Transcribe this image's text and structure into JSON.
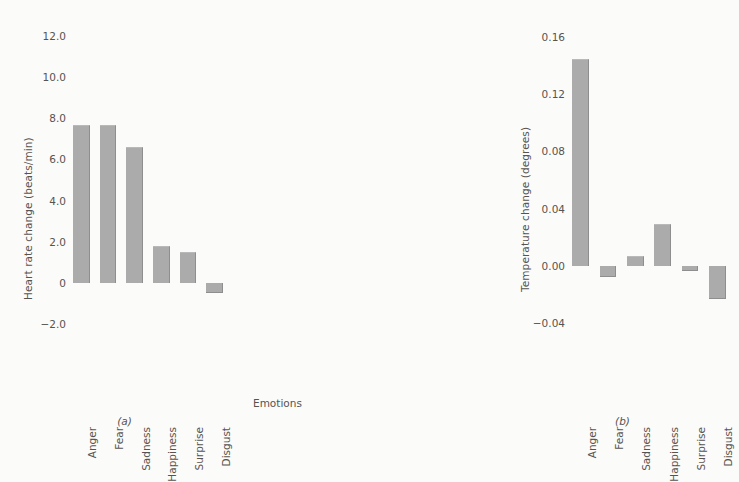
{
  "chart_data": [
    {
      "type": "bar",
      "panel": "a",
      "caption": "(a)",
      "title": "",
      "xlabel": "",
      "ylabel": "Heart rate change (beats/min)",
      "categories": [
        "Anger",
        "Fear",
        "Sadness",
        "Happiness",
        "Surprise",
        "Disgust"
      ],
      "values": [
        7.7,
        7.7,
        6.6,
        1.8,
        1.5,
        -0.5
      ],
      "yticks": [
        "12.0",
        "10.0",
        "8.0",
        "6.0",
        "4.0",
        "2.0",
        "0",
        "-2.0"
      ],
      "ytickvalues": [
        12.0,
        10.0,
        8.0,
        6.0,
        4.0,
        2.0,
        0,
        -2.0
      ],
      "ylim": [
        -2.8,
        12.8
      ],
      "grid": false,
      "legend": "none",
      "bar_color": "#ababab"
    },
    {
      "type": "bar",
      "panel": "b",
      "caption": "(b)",
      "title": "",
      "xlabel": "Emotions",
      "ylabel": "Temperature change (degrees)",
      "categories": [
        "Anger",
        "Fear",
        "Sadness",
        "Happiness",
        "Surprise",
        "Disgust"
      ],
      "values": [
        0.145,
        -0.008,
        0.007,
        0.029,
        -0.004,
        -0.023
      ],
      "yticks": [
        "0.16",
        "0.12",
        "0.08",
        "0.04",
        "0.00",
        "-0.04"
      ],
      "ytickvalues": [
        0.16,
        0.12,
        0.08,
        0.04,
        0.0,
        -0.04
      ],
      "ylim": [
        -0.052,
        0.172
      ],
      "grid": false,
      "legend": "none",
      "bar_color": "#ababab"
    }
  ]
}
